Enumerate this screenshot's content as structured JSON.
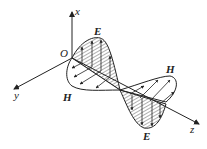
{
  "diagram": {
    "labels": {
      "x_axis": "x",
      "y_axis": "y",
      "z_axis": "z",
      "origin": "O",
      "E_top": "E",
      "E_bottom": "E",
      "H_left": "H",
      "H_right": "H"
    },
    "colors": {
      "stroke": "#222222",
      "background": "#ffffff"
    }
  }
}
